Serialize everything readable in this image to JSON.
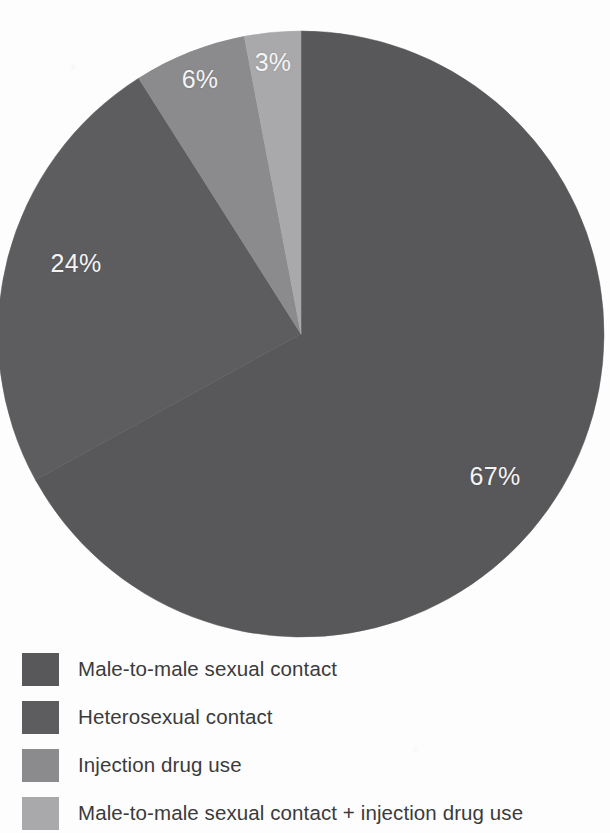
{
  "chart_data": {
    "type": "pie",
    "title": "",
    "subtitle": "",
    "xlabel": "",
    "ylabel": "",
    "legend_position": "bottom-left",
    "grid": false,
    "start_angle_deg": 0,
    "direction": "clockwise",
    "categories": [
      "Male-to-male sexual contact",
      "Heterosexual contact",
      "Injection drug use",
      "Male-to-male sexual contact + injection drug use"
    ],
    "values": [
      67,
      24,
      6,
      3
    ],
    "value_labels": [
      "67%",
      "24%",
      "6%",
      "3%"
    ],
    "colors": [
      "#58585a",
      "#5d5d5f",
      "#8b8b8d",
      "#a9a9ab"
    ],
    "slices": [
      {
        "label": "Male-to-male sexual contact",
        "value": 67,
        "display": "67%",
        "color": "#58585a",
        "label_x": 495,
        "label_y": 476
      },
      {
        "label": "Heterosexual contact",
        "value": 24,
        "display": "24%",
        "color": "#5d5d5f",
        "label_x": 76,
        "label_y": 263
      },
      {
        "label": "Injection drug use",
        "value": 6,
        "display": "6%",
        "color": "#8b8b8d",
        "label_x": 200,
        "label_y": 79
      },
      {
        "label": "Male-to-male sexual contact + injection drug use",
        "value": 3,
        "display": "3%",
        "color": "#a9a9ab",
        "label_x": 273,
        "label_y": 62
      }
    ]
  },
  "legend": {
    "items": [
      {
        "label": "Male-to-male sexual contact",
        "color": "#58585a",
        "top": 6
      },
      {
        "label": "Heterosexual contact",
        "color": "#5d5d5f",
        "top": 54
      },
      {
        "label": "Injection drug use",
        "color": "#8b8b8d",
        "top": 102
      },
      {
        "label": "Male-to-male sexual contact + injection drug use",
        "color": "#a9a9ab",
        "top": 150
      }
    ]
  },
  "geometry": {
    "center_x": 301,
    "center_y": 334,
    "radius": 303
  }
}
